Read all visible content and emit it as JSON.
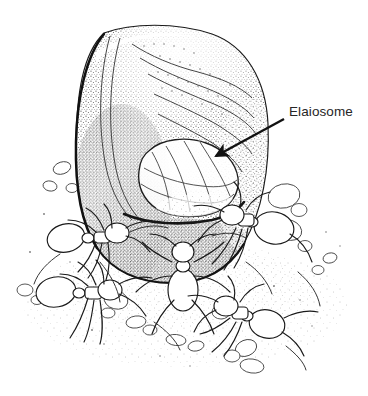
{
  "figure": {
    "domain": "Natural-Image",
    "medium": "pen-and-ink stipple scientific illustration",
    "background_color": "#ffffff",
    "ink_color": "#1a1a1a",
    "canvas": {
      "width": 368,
      "height": 396
    }
  },
  "annotations": [
    {
      "name": "elaiosome-label",
      "text": "Elaiosome",
      "text_color": "#262626",
      "font_size_px": 13.5,
      "text_x": 289,
      "text_y": 104,
      "leader_line": {
        "from_x": 284,
        "from_y": 119,
        "to_x": 213,
        "to_y": 158,
        "stroke_width": 2.4,
        "arrowhead": "filled-triangle",
        "color": "#111111"
      }
    }
  ],
  "structures": {
    "seed": {
      "label": "seed body",
      "outline_color": "#151515",
      "fill_tone": "#ffffff",
      "shading": "graded stipple, dark along lower left and lower margin",
      "bounds": {
        "x": 74,
        "y": 26,
        "width": 196,
        "height": 256
      },
      "ridge_lines": 7
    },
    "elaiosome": {
      "label": "elaiosome",
      "description": "pale lobed fleshy appendage at lower front of seed",
      "outline_color": "#2a2a2a",
      "fill_tone": "#fdfdfd",
      "bounds": {
        "x": 136,
        "y": 138,
        "width": 104,
        "height": 78
      },
      "lobe_creases": 6
    },
    "ground": {
      "label": "sandy substrate",
      "description": "scattered sand grains and pebbles with light stipple",
      "pebble_count": 21
    }
  },
  "ants": [
    {
      "name": "ant-left-upper",
      "orientation": "side view, facing right",
      "x": 96,
      "y": 236
    },
    {
      "name": "ant-left-lower",
      "orientation": "side view, facing right",
      "x": 84,
      "y": 292
    },
    {
      "name": "ant-center-front",
      "orientation": "front view, head up",
      "x": 183,
      "y": 268
    },
    {
      "name": "ant-right-upper",
      "orientation": "side view, facing left",
      "x": 252,
      "y": 222
    },
    {
      "name": "ant-right-lower",
      "orientation": "side view, facing left",
      "x": 243,
      "y": 306
    }
  ],
  "counts": {
    "ants_visible": 5,
    "labels": 1,
    "leader_arrows": 1
  }
}
